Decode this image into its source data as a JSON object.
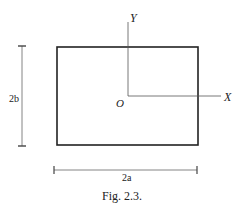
{
  "figure": {
    "caption": "Fig. 2.3.",
    "labels": {
      "y_axis": "Y",
      "x_axis": "X",
      "origin": "O",
      "height_dim": "2b",
      "width_dim": "2a"
    },
    "colors": {
      "stroke": "#222222",
      "axis": "#555555",
      "dimension": "#666666"
    }
  }
}
